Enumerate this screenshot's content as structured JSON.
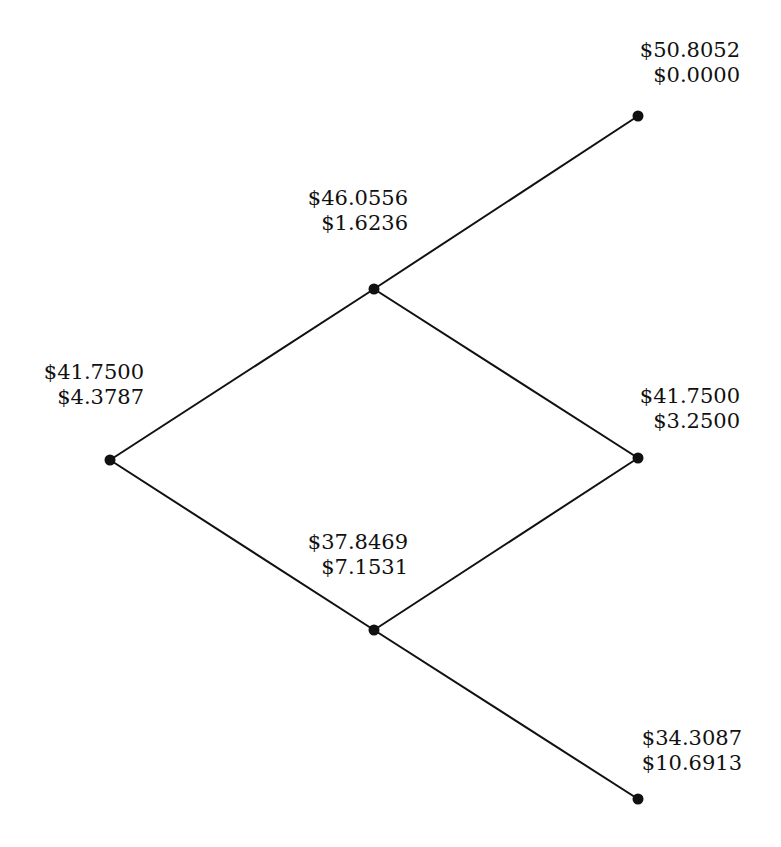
{
  "diagram": {
    "type": "binomial-tree",
    "colors": {
      "line": "#111111",
      "node": "#111111",
      "text": "#111111",
      "background": "#ffffff"
    },
    "nodes": [
      {
        "id": "root",
        "price": "$41.7500",
        "option": "$4.3787",
        "x": 110,
        "y": 460,
        "label_left": 42,
        "label_top": 362,
        "label_width": 102
      },
      {
        "id": "u",
        "price": "$46.0556",
        "option": "$1.6236",
        "x": 374,
        "y": 289,
        "label_left": 306,
        "label_top": 188,
        "label_width": 102
      },
      {
        "id": "d",
        "price": "$37.8469",
        "option": "$7.1531",
        "x": 374,
        "y": 630,
        "label_left": 306,
        "label_top": 532,
        "label_width": 102
      },
      {
        "id": "uu",
        "price": "$50.8052",
        "option": "$0.0000",
        "x": 638,
        "y": 116,
        "label_left": 638,
        "label_top": 40,
        "label_width": 102
      },
      {
        "id": "ud",
        "price": "$41.7500",
        "option": "$3.2500",
        "x": 638,
        "y": 458,
        "label_left": 638,
        "label_top": 386,
        "label_width": 102
      },
      {
        "id": "dd",
        "price": "$34.3087",
        "option": "$10.6913",
        "x": 638,
        "y": 799,
        "label_left": 638,
        "label_top": 728,
        "label_width": 104
      }
    ],
    "edges": [
      [
        "root",
        "u"
      ],
      [
        "root",
        "d"
      ],
      [
        "u",
        "uu"
      ],
      [
        "u",
        "ud"
      ],
      [
        "d",
        "ud"
      ],
      [
        "d",
        "dd"
      ]
    ]
  }
}
